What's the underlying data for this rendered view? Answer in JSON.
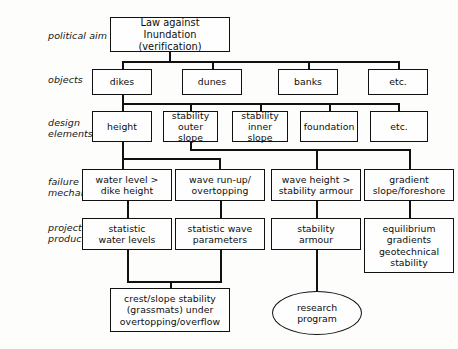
{
  "diagram": {
    "row_labels": [
      {
        "id": "political-aim",
        "text": "political aim"
      },
      {
        "id": "objects",
        "text": "objects"
      },
      {
        "id": "design-elements",
        "text": "design\nelements"
      },
      {
        "id": "failure-mechanisms",
        "text": "failure\nmechanisms"
      },
      {
        "id": "projects-products",
        "text": "projects/\nproducts"
      }
    ],
    "nodes": {
      "root": "Law against Inundation\n(verification)",
      "obj_dikes": "dikes",
      "obj_dunes": "dunes",
      "obj_banks": "banks",
      "obj_etc": "etc.",
      "de_height": "height",
      "de_stab_outer": "stability\nouter slope",
      "de_stab_inner": "stability\ninner slope",
      "de_foundation": "foundation",
      "de_etc": "etc.",
      "fm_water_level": "water level >\ndike height",
      "fm_wave_runup": "wave run-up/\novertopping",
      "fm_wave_height": "wave height >\nstability armour",
      "fm_gradient": "gradient\nslope/foreshore",
      "pp_stat_water": "statistic\nwater levels",
      "pp_stat_wave": "statistic wave\nparameters",
      "pp_stab_armour": "stability\narmour",
      "pp_equilibrium": "equilibrium\ngradients\ngeotechnical\nstability",
      "out_crest": "crest/slope stability\n(grassmats) under\novertopping/overflow",
      "out_research": "research\nprogram"
    },
    "colors": {
      "stroke": "#111111",
      "background": "#fdfdfc",
      "node_fill": "#fefefe",
      "text": "#0d0d0d"
    }
  }
}
